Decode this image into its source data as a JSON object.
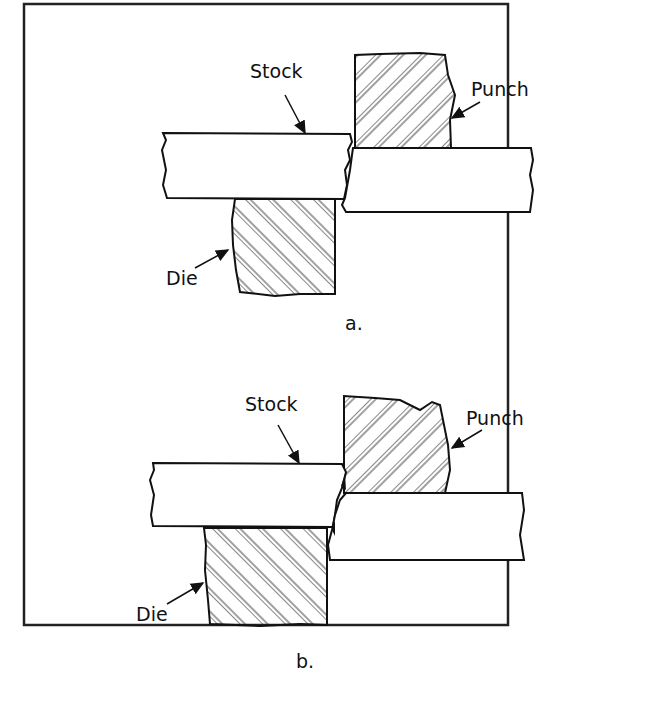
{
  "panel_a": {
    "labels": {
      "stock": "Stock",
      "punch": "Punch",
      "die": "Die"
    },
    "caption": "a."
  },
  "panel_b": {
    "labels": {
      "stock": "Stock",
      "punch": "Punch",
      "die": "Die"
    },
    "caption": "b."
  },
  "colors": {
    "line": "#111111",
    "background": "#ffffff"
  }
}
